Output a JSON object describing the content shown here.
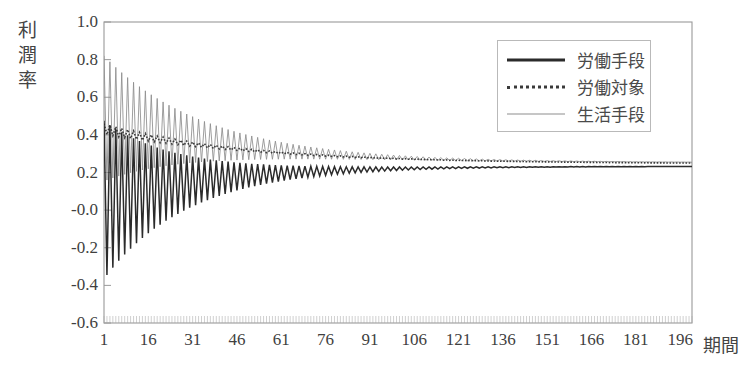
{
  "chart_data": {
    "type": "line",
    "title": "",
    "xlabel": "期間",
    "ylabel": "利潤率",
    "xlim": [
      1,
      200
    ],
    "ylim": [
      -0.6,
      1.0
    ],
    "grid": false,
    "legend_position": "top-right",
    "ytick_labels": [
      "1.0",
      "0.8",
      "0.6",
      "0.4",
      "0.2",
      "-0.0",
      "-0.2",
      "-0.4",
      "-0.6"
    ],
    "ytick_values": [
      1.0,
      0.8,
      0.6,
      0.4,
      0.2,
      0.0,
      -0.2,
      -0.4,
      -0.6
    ],
    "xtick_labels": [
      "1",
      "16",
      "31",
      "46",
      "61",
      "76",
      "91",
      "106",
      "121",
      "136",
      "151",
      "166",
      "181",
      "196"
    ],
    "xtick_values": [
      1,
      16,
      31,
      46,
      61,
      76,
      91,
      106,
      121,
      136,
      151,
      166,
      181,
      196
    ],
    "series": [
      {
        "name": "労働手段",
        "style": "thick-solid",
        "color": "#2b2b2b",
        "start_value": 0.47,
        "first_trough": -0.38,
        "converges_to": 0.232,
        "envelope_note": "damped oscillation, amplitude decays from about 0.43 to about 0.015",
        "description": "profit rate of means-of-labour sector; oscillates strongly between -0.38 and 0.47 in early periods then converges"
      },
      {
        "name": "労働対象",
        "style": "dotted",
        "color": "#3a3a3a",
        "start_value": 0.455,
        "first_trough": 0.4,
        "converges_to": 0.245,
        "envelope_note": "small-amplitude damped oscillation around a slowly declining mean",
        "description": "profit rate of objects-of-labour sector; starts near 0.46 and declines smoothly to about 0.245"
      },
      {
        "name": "生活手段",
        "style": "thin-solid",
        "color": "#8d8d8d",
        "start_value": 0.81,
        "first_trough": 0.44,
        "converges_to": 0.252,
        "envelope_note": "damped oscillation, amplitude decays from about 0.34 to about 0.012",
        "description": "profit rate of means-of-subsistence sector; peaks at 0.81 then damps toward 0.25"
      }
    ]
  },
  "axis": {
    "y_title": "利潤率",
    "x_title": "期間"
  },
  "legend": {
    "items": [
      {
        "label": "労働手段"
      },
      {
        "label": "労働対象"
      },
      {
        "label": "生活手段"
      }
    ]
  },
  "colors": {
    "series_1": "#2b2b2b",
    "series_2": "#3a3a3a",
    "series_3": "#8d8d8d",
    "axis": "#9a9a9a",
    "text": "#3f3f3f",
    "background": "#ffffff"
  }
}
